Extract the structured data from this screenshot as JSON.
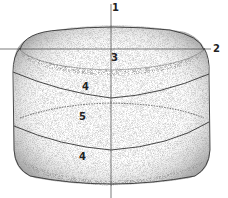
{
  "figure": {
    "axes": [
      {
        "id": "axis-1",
        "label": "1",
        "orientation": "vertical"
      },
      {
        "id": "axis-2",
        "label": "2",
        "orientation": "horizontal"
      }
    ],
    "regions": [
      {
        "id": "region-top",
        "label": "3"
      },
      {
        "id": "region-upper-band",
        "label": "4"
      },
      {
        "id": "region-middle",
        "label": "5"
      },
      {
        "id": "region-lower-band",
        "label": "4"
      }
    ],
    "colors": {
      "ink": "#333333",
      "stipple": "#777777",
      "background": "#ffffff"
    }
  }
}
